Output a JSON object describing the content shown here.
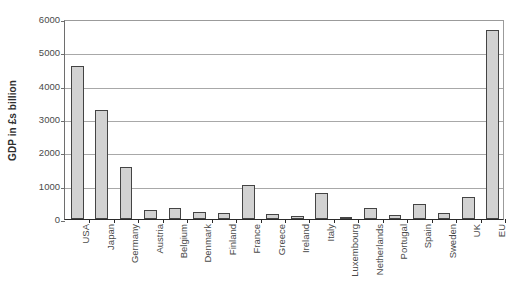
{
  "chart_data": {
    "type": "bar",
    "title": "",
    "xlabel": "",
    "ylabel": "GDP in £s billion",
    "ylim": [
      0,
      6000
    ],
    "ytick_labels": [
      "6000",
      "5000",
      "4000",
      "3000",
      "2000",
      "1000",
      "0"
    ],
    "ytick_values": [
      6000,
      5000,
      4000,
      3000,
      2000,
      1000,
      0
    ],
    "grid": "horizontal",
    "legend": "none",
    "bar_fill_color": "#d2d2d2",
    "bar_border_color": "#444444",
    "categories": [
      "USA",
      "Japan",
      "Germany",
      "Austria",
      "Belgium",
      "Denmark",
      "Finland",
      "France",
      "Greece",
      "Ireland",
      "Italy",
      "Luxembourg",
      "Netherlands",
      "Portugal",
      "Spain",
      "Sweden",
      "UK",
      "EU"
    ],
    "values": [
      4600,
      3280,
      1570,
      280,
      340,
      200,
      170,
      1030,
      150,
      90,
      780,
      15,
      330,
      120,
      450,
      180,
      660,
      5660
    ]
  }
}
